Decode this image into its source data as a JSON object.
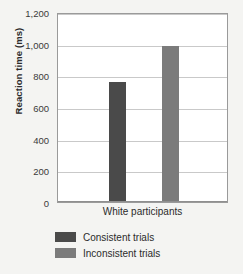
{
  "chart_data": {
    "type": "bar",
    "title": "",
    "xlabel": "",
    "ylabel": "Reaction time (ms)",
    "categories": [
      "White participants"
    ],
    "series": [
      {
        "name": "Consistent trials",
        "values": [
          750
        ],
        "color": "#4a4a4a"
      },
      {
        "name": "Inconsistent trials",
        "values": [
          980
        ],
        "color": "#7b7b7b"
      }
    ],
    "ylim": [
      0,
      1200
    ],
    "yticks": [
      0,
      200,
      400,
      600,
      800,
      1000,
      1200
    ],
    "ytick_labels": [
      "0",
      "200",
      "400",
      "600",
      "800",
      "1,000",
      "1,200"
    ],
    "grid": true,
    "legend_position": "bottom-left"
  },
  "axes": {
    "y_title": "Reaction time (ms)",
    "x_categories": [
      "White participants"
    ]
  },
  "legend": {
    "items": [
      {
        "label": "Consistent trials",
        "color": "#4a4a4a"
      },
      {
        "label": "Inconsistent trials",
        "color": "#7b7b7b"
      }
    ]
  },
  "colors": {
    "background": "#f4f4f2",
    "plot_background": "#ffffff",
    "gridline": "#c9c9c9",
    "frame": "#9a9a9a",
    "text": "#2b2b2b",
    "bar_consistent": "#4a4a4a",
    "bar_inconsistent": "#7b7b7b"
  }
}
